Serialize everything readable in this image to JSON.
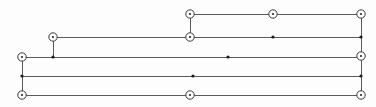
{
  "figure": {
    "width": 376,
    "height": 107,
    "background_color": "#fdfdfd",
    "line_color": "#5a5a5a",
    "node_stroke_color": "#3a3a3a",
    "node_fill_color": "#ffffff",
    "dot_color": "#1c1c1c"
  },
  "chart_data": {
    "type": "scatter",
    "xlabel": "",
    "ylabel": "",
    "grid": false,
    "legend": "none",
    "xlim": [
      0,
      376
    ],
    "ylim": [
      0,
      107
    ],
    "horizontal_lines": [
      {
        "name": "row-1",
        "y": 14,
        "x_start": 190,
        "x_end": 361
      },
      {
        "name": "row-2",
        "y": 37,
        "x_start": 53,
        "x_end": 361
      },
      {
        "name": "row-3",
        "y": 57,
        "x_start": 22,
        "x_end": 361
      },
      {
        "name": "row-4",
        "y": 76,
        "x_start": 22,
        "x_end": 361
      },
      {
        "name": "row-5",
        "y": 95,
        "x_start": 22,
        "x_end": 361
      }
    ],
    "vertical_lines": [
      {
        "name": "stub-left",
        "x": 53,
        "y_start": 37,
        "y_end": 57
      },
      {
        "name": "stub-mid",
        "x": 190,
        "y_start": 14,
        "y_end": 37
      },
      {
        "name": "spine-left",
        "x": 22,
        "y_start": 57,
        "y_end": 95
      },
      {
        "name": "spine-right",
        "x": 361,
        "y_start": 14,
        "y_end": 95
      }
    ],
    "ring_nodes": [
      {
        "name": "node-a",
        "x": 53,
        "y": 37
      },
      {
        "name": "node-b",
        "x": 190,
        "y": 14
      },
      {
        "name": "node-c",
        "x": 190,
        "y": 37
      },
      {
        "name": "node-d",
        "x": 190,
        "y": 95
      },
      {
        "name": "node-e",
        "x": 273,
        "y": 14
      },
      {
        "name": "node-f",
        "x": 361,
        "y": 14
      },
      {
        "name": "node-g",
        "x": 361,
        "y": 56
      },
      {
        "name": "node-h",
        "x": 361,
        "y": 95
      },
      {
        "name": "node-i",
        "x": 22,
        "y": 57
      },
      {
        "name": "node-j",
        "x": 22,
        "y": 95
      }
    ],
    "dot_nodes": [
      {
        "name": "dot-a",
        "x": 53,
        "y": 57
      },
      {
        "name": "dot-b",
        "x": 273,
        "y": 37
      },
      {
        "name": "dot-c",
        "x": 228,
        "y": 57
      },
      {
        "name": "dot-d",
        "x": 193,
        "y": 76
      },
      {
        "name": "dot-e",
        "x": 22,
        "y": 76
      },
      {
        "name": "dot-f",
        "x": 361,
        "y": 37
      },
      {
        "name": "dot-g",
        "x": 361,
        "y": 76
      }
    ],
    "ring_outer_radius": 4.2,
    "ring_core_radius": 1.1,
    "dot_radius": 1.6
  }
}
